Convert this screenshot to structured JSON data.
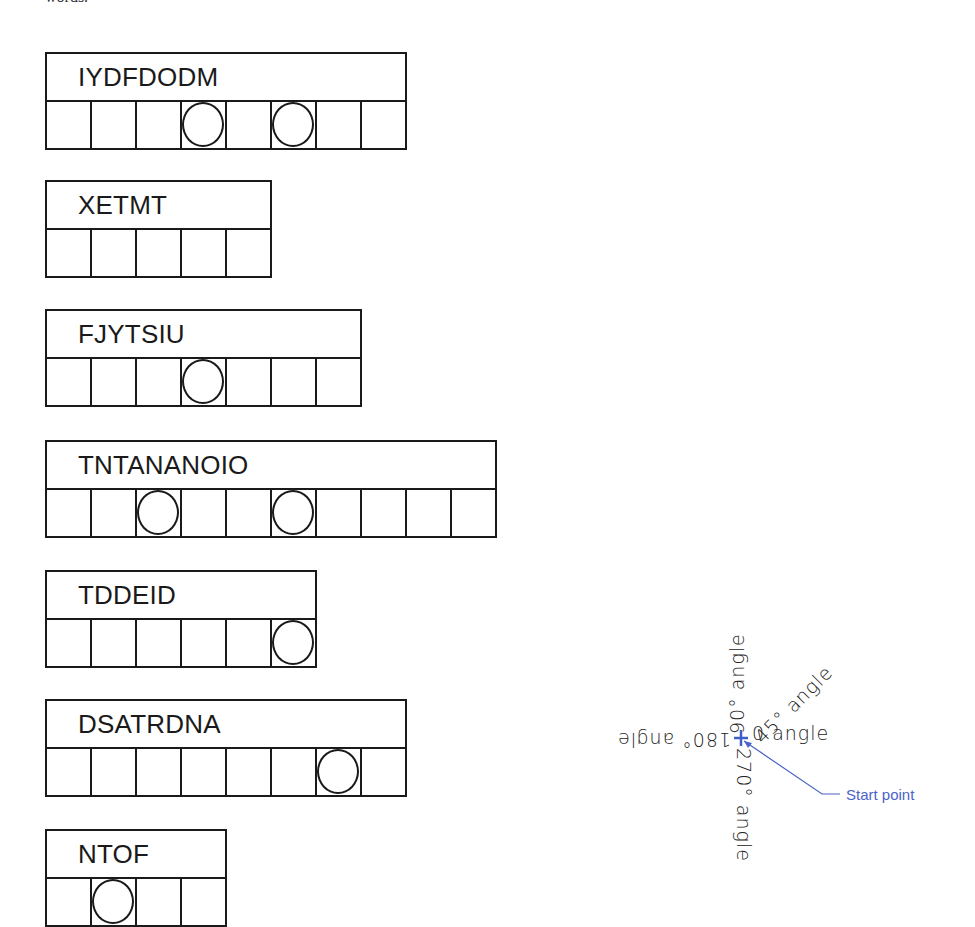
{
  "cutoff_text": "words.",
  "puzzles": [
    {
      "word": "IYDFDODM",
      "cells": 8,
      "circled": [
        3,
        5
      ],
      "top": 52
    },
    {
      "word": "XETMT",
      "cells": 5,
      "circled": [],
      "top": 180
    },
    {
      "word": "FJYTSIU",
      "cells": 7,
      "circled": [
        3
      ],
      "top": 309
    },
    {
      "word": "TNTANANOIO",
      "cells": 10,
      "circled": [
        2,
        5
      ],
      "top": 440
    },
    {
      "word": "TDDEID",
      "cells": 6,
      "circled": [
        5
      ],
      "top": 570
    },
    {
      "word": "DSATRDNA",
      "cells": 8,
      "circled": [
        6
      ],
      "top": 699
    },
    {
      "word": "NTOF",
      "cells": 4,
      "circled": [
        1
      ],
      "top": 829
    }
  ],
  "angle_diagram": {
    "labels": {
      "zero": "0 angle",
      "deg45": "45° angle",
      "deg90": "90° angle",
      "deg180": "180° angle",
      "deg270": "270° angle"
    },
    "start_point_label": "Start point",
    "start_point_icon": "crosshair-icon",
    "accent_color": "#4a63c8"
  }
}
